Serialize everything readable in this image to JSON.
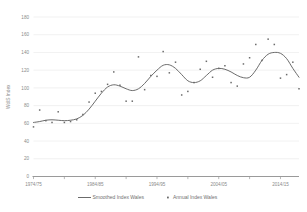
{
  "chart_data": {
    "type": "scatter",
    "title": "",
    "xlabel": "",
    "ylabel": "WdlS Index",
    "ylim": [
      0,
      180
    ],
    "ytick_step": 20,
    "yticks": [
      0,
      20,
      40,
      60,
      80,
      100,
      120,
      140,
      160,
      180
    ],
    "ytick_labels": [
      "0",
      "20",
      "40",
      "60",
      "80",
      "100",
      "120",
      "140",
      "160",
      "180"
    ],
    "xticks": [
      "1974/75",
      "1984/85",
      "1994/95",
      "2004/05",
      "2014/15"
    ],
    "xtick_labels": [
      "1974/75",
      "1984/85",
      "1994/95",
      "2004/05",
      "2014/15"
    ],
    "x_minor_tick_interval_years": 5,
    "x_range_start": "1974/75",
    "x_range_end": "2018/19",
    "grid": true,
    "legend_position": "bottom",
    "series": [
      {
        "name": "Smoothed Index Wales",
        "type": "line",
        "color": "#5a5a5a",
        "x": [
          "1974/75",
          "1975/76",
          "1976/77",
          "1977/78",
          "1978/79",
          "1979/80",
          "1980/81",
          "1981/82",
          "1982/83",
          "1983/84",
          "1984/85",
          "1985/86",
          "1986/87",
          "1987/88",
          "1988/89",
          "1989/90",
          "1990/91",
          "1991/92",
          "1992/93",
          "1993/94",
          "1994/95",
          "1995/96",
          "1996/97",
          "1997/98",
          "1998/99",
          "1999/00",
          "2000/01",
          "2001/02",
          "2002/03",
          "2003/04",
          "2004/05",
          "2005/06",
          "2006/07",
          "2007/08",
          "2008/09",
          "2009/10",
          "2010/11",
          "2011/12",
          "2012/13",
          "2013/14",
          "2014/15",
          "2015/16",
          "2016/17",
          "2017/18"
        ],
        "values": [
          61,
          62,
          63.5,
          64,
          63.5,
          63,
          63.5,
          65,
          69,
          76,
          85,
          94,
          101,
          103.5,
          102,
          99,
          97,
          99,
          105,
          113,
          120,
          125.5,
          126,
          122,
          115,
          108,
          106,
          108,
          114,
          120,
          122,
          121,
          118,
          114,
          111.5,
          112,
          120,
          131,
          138,
          140,
          139,
          133,
          122,
          112
        ]
      },
      {
        "name": "Annual Index Wales",
        "type": "scatter",
        "color": "#6b6b6b",
        "marker": "square",
        "x": [
          "1974/75",
          "1975/76",
          "1976/77",
          "1977/78",
          "1978/79",
          "1979/80",
          "1980/81",
          "1981/82",
          "1982/83",
          "1983/84",
          "1984/85",
          "1985/86",
          "1986/87",
          "1987/88",
          "1988/89",
          "1989/90",
          "1990/91",
          "1991/92",
          "1992/93",
          "1993/94",
          "1994/95",
          "1995/96",
          "1996/97",
          "1997/98",
          "1998/99",
          "1999/00",
          "2000/01",
          "2001/02",
          "2002/03",
          "2003/04",
          "2004/05",
          "2005/06",
          "2006/07",
          "2007/08",
          "2008/09",
          "2009/10",
          "2010/11",
          "2011/12",
          "2012/13",
          "2013/14",
          "2014/15",
          "2015/16",
          "2016/17",
          "2017/18"
        ],
        "values": [
          56,
          75,
          63,
          61,
          73,
          61,
          62,
          64,
          70,
          84,
          94,
          96,
          104,
          118,
          103,
          85,
          85,
          135,
          98,
          114,
          113,
          141,
          117,
          129,
          92,
          96,
          106,
          121,
          130,
          112,
          122,
          125,
          106,
          102,
          127,
          134,
          149,
          131,
          155,
          149,
          111,
          115,
          129,
          99
        ]
      }
    ]
  },
  "legend": {
    "items": [
      {
        "label": "Smoothed Index Wales",
        "marker": "line",
        "color": "#5a5a5a"
      },
      {
        "label": "Annual Index Wales",
        "marker": "square",
        "color": "#6b6b6b"
      }
    ]
  },
  "axes": {
    "y_title": "WdlS Index"
  }
}
